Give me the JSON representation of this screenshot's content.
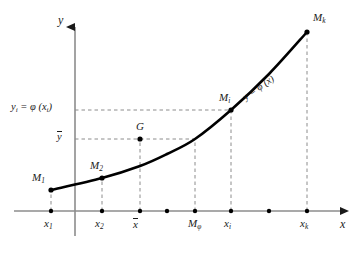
{
  "figure": {
    "type": "math-diagram",
    "colors": {
      "curve": "#000000",
      "axis": "#8c8c8c",
      "dashed": "#8c8c8c",
      "dot": "#000000",
      "text": "#1a1a1a",
      "background": "#ffffff"
    }
  },
  "axes": {
    "y_axis_label": "y",
    "x_axis_label": "x",
    "origin_px": {
      "x": 75,
      "y": 211
    },
    "y_axis_top_px": 18,
    "x_axis_right_px": 348
  },
  "curve": {
    "label": "y = φ (x)",
    "label_angle_deg": -35,
    "points_px": [
      {
        "x": 51,
        "y": 190
      },
      {
        "x": 102,
        "y": 178
      },
      {
        "x": 140,
        "y": 166
      },
      {
        "x": 167,
        "y": 154
      },
      {
        "x": 195,
        "y": 139
      },
      {
        "x": 231,
        "y": 110
      },
      {
        "x": 269,
        "y": 74
      },
      {
        "x": 307,
        "y": 32
      }
    ]
  },
  "curve_points": [
    {
      "name": "M1",
      "label_html": "M<span class=\"sub\">1</span>",
      "x_px": 51,
      "y_px": 190,
      "label_x_px": 32,
      "label_y_px": 172
    },
    {
      "name": "M2",
      "label_html": "M<span class=\"sub\">2</span>",
      "x_px": 102,
      "y_px": 178,
      "label_x_px": 90,
      "label_y_px": 160
    },
    {
      "name": "Mi",
      "label_html": "M<span class=\"sub\">i</span>",
      "x_px": 231,
      "y_px": 110,
      "label_x_px": 219,
      "label_y_px": 92
    },
    {
      "name": "Mk",
      "label_html": "M<span class=\"sub\">k</span>",
      "x_px": 307,
      "y_px": 32,
      "label_x_px": 313,
      "label_y_px": 12
    },
    {
      "name": "G",
      "label_html": "G",
      "x_px": 140,
      "y_px": 139,
      "label_x_px": 136,
      "label_y_px": 121
    }
  ],
  "x_ticks": [
    {
      "label_html": "x<span class=\"sub\">1</span>",
      "x_px": 51,
      "dashed": true,
      "dash_top_px": 190
    },
    {
      "label_html": "x<span class=\"sub\">2</span>",
      "x_px": 102,
      "dashed": true,
      "dash_top_px": 178
    },
    {
      "label_html": "",
      "x_px": 140,
      "dashed": false,
      "dash_top_px": 211
    },
    {
      "label_html": "<span class=\"ovl\">x</span>",
      "x_px": 140,
      "dashed": true,
      "dash_top_px": 139
    },
    {
      "label_html": "",
      "x_px": 167,
      "dashed": false,
      "dash_top_px": 211
    },
    {
      "label_html": "M<span class=\"sub\">φ</span>",
      "x_px": 195,
      "dashed": true,
      "dash_top_px": 139
    },
    {
      "label_html": "x<span class=\"sub\">i</span>",
      "x_px": 231,
      "dashed": true,
      "dash_top_px": 110
    },
    {
      "label_html": "",
      "x_px": 269,
      "dashed": false,
      "dash_top_px": 211
    },
    {
      "label_html": "x<span class=\"sub\">k</span>",
      "x_px": 307,
      "dashed": true,
      "dash_top_px": 32
    }
  ],
  "x_axis_dots_px": [
    51,
    102,
    140,
    167,
    195,
    231,
    269,
    307
  ],
  "y_labels": [
    {
      "name": "yi-equals-phi-xi",
      "text_html": "y<span class=\"sub\">i</span> = φ (x<span class=\"sub\">i</span>)",
      "y_px": 110,
      "dash_from_px": 75,
      "dash_to_px": 231,
      "label_x_px": 11,
      "label_y_px": 102
    },
    {
      "name": "y-bar",
      "text_html": "<span class=\"ovl\">y</span>",
      "y_px": 139,
      "dash_from_px": 75,
      "dash_to_px": 195,
      "label_x_px": 57,
      "label_y_px": 131
    }
  ]
}
